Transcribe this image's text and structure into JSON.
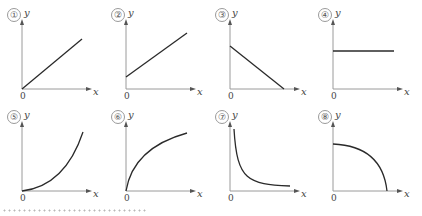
{
  "diagram": {
    "axis_labels": {
      "x": "x",
      "y": "y",
      "origin": "0"
    },
    "colors": {
      "axis": "#9a9a9a",
      "curve": "#2a2a2a",
      "dots": "#b8b8b8"
    },
    "panels": [
      {
        "id": "1",
        "label": "①",
        "shape": "straight line through origin (proportional)"
      },
      {
        "id": "2",
        "label": "②",
        "shape": "straight line with positive y-intercept"
      },
      {
        "id": "3",
        "label": "③",
        "shape": "straight line decreasing to x-axis"
      },
      {
        "id": "4",
        "label": "④",
        "shape": "horizontal line (constant)"
      },
      {
        "id": "5",
        "label": "⑤",
        "shape": "upward curving from origin (parabola)"
      },
      {
        "id": "6",
        "label": "⑥",
        "shape": "concave curve from origin (square root)"
      },
      {
        "id": "7",
        "label": "⑦",
        "shape": "decreasing hyperbola (inverse)"
      },
      {
        "id": "8",
        "label": "⑧",
        "shape": "quarter circle arc"
      }
    ]
  }
}
